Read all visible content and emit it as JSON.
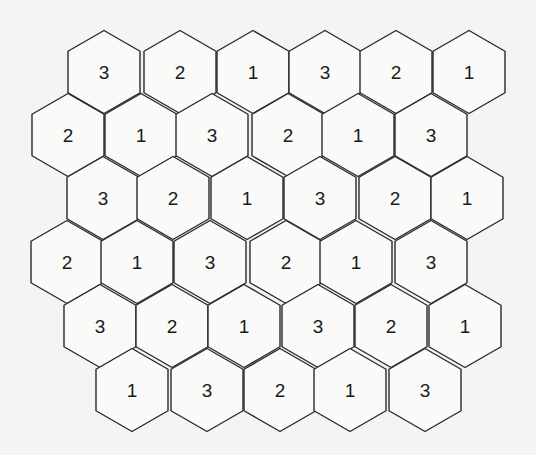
{
  "diagram": {
    "type": "hexagonal-cell-grid",
    "label_set": [
      "1",
      "2",
      "3"
    ],
    "hex": {
      "orientation": "pointy-top",
      "width": 72,
      "radius": 41.5,
      "row_step": 63
    },
    "colors": {
      "stroke": "#2a2a2a",
      "fill": "#fafaf8",
      "text": "#1a1a1a",
      "background": "#f4f4f2"
    },
    "rows": [
      {
        "y": 72,
        "cells": [
          {
            "x": 104,
            "label": "3"
          },
          {
            "x": 180,
            "label": "2"
          },
          {
            "x": 253,
            "label": "1"
          },
          {
            "x": 325,
            "label": "3"
          },
          {
            "x": 396,
            "label": "2"
          },
          {
            "x": 469,
            "label": "1"
          }
        ]
      },
      {
        "y": 135,
        "cells": [
          {
            "x": 68,
            "label": "2"
          },
          {
            "x": 141,
            "label": "1"
          },
          {
            "x": 212,
            "label": "3"
          },
          {
            "x": 288,
            "label": "2"
          },
          {
            "x": 358,
            "label": "1"
          },
          {
            "x": 431,
            "label": "3"
          }
        ]
      },
      {
        "y": 198,
        "cells": [
          {
            "x": 103,
            "label": "3"
          },
          {
            "x": 173,
            "label": "2"
          },
          {
            "x": 247,
            "label": "1"
          },
          {
            "x": 320,
            "label": "3"
          },
          {
            "x": 395,
            "label": "2"
          },
          {
            "x": 467,
            "label": "1"
          }
        ]
      },
      {
        "y": 262,
        "cells": [
          {
            "x": 67,
            "label": "2"
          },
          {
            "x": 137,
            "label": "1"
          },
          {
            "x": 210,
            "label": "3"
          },
          {
            "x": 286,
            "label": "2"
          },
          {
            "x": 356,
            "label": "1"
          },
          {
            "x": 431,
            "label": "3"
          }
        ]
      },
      {
        "y": 326,
        "cells": [
          {
            "x": 100,
            "label": "3"
          },
          {
            "x": 172,
            "label": "2"
          },
          {
            "x": 244,
            "label": "1"
          },
          {
            "x": 318,
            "label": "3"
          },
          {
            "x": 391,
            "label": "2"
          },
          {
            "x": 465,
            "label": "1"
          }
        ]
      },
      {
        "y": 390,
        "cells": [
          {
            "x": 132,
            "label": "1"
          },
          {
            "x": 207,
            "label": "3"
          },
          {
            "x": 280,
            "label": "2"
          },
          {
            "x": 350,
            "label": "1"
          },
          {
            "x": 425,
            "label": "3"
          }
        ]
      }
    ]
  }
}
